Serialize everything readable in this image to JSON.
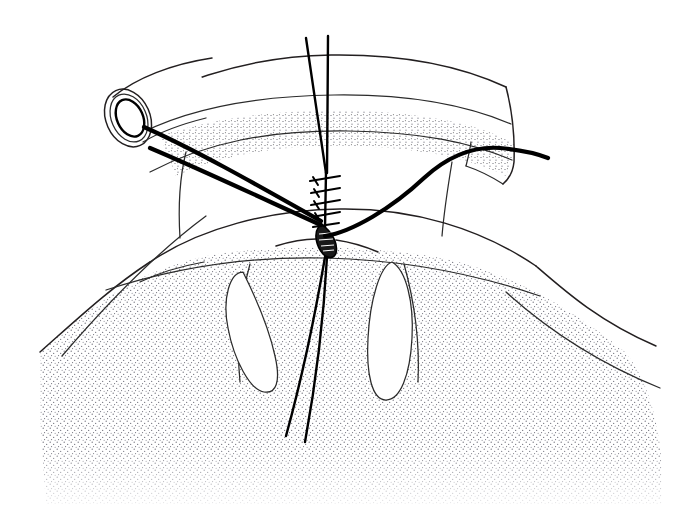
{
  "figure": {
    "kind": "line-art-illustration",
    "width": 699,
    "height": 516,
    "background_color": "#ffffff",
    "ink_color": "#000000",
    "hairline_color": "#2b2b2b",
    "stipple_color": "#5a5a66",
    "has_text_labels": false,
    "label_text": "",
    "caption_text": ""
  },
  "elements": {
    "tube": {
      "name": "tubular-graft-conduit",
      "end_ring_outer": "ellipse",
      "end_ring_inner": "ellipse",
      "lumen": "ellipse"
    },
    "band": {
      "name": "arched-band-upper",
      "fill": "#ffffff",
      "stipple_fill": "#ffffff"
    },
    "stippled_band": {
      "name": "stippled-arch-strip",
      "texture": "fine-dot-stipple"
    },
    "body": {
      "name": "stippled-organ-body",
      "texture": "fine-dot-stipple"
    },
    "suture_line": {
      "name": "running-suture-line",
      "stitch_count": 5
    },
    "incision": {
      "name": "almond-incision-aperture",
      "hatch_count": 4
    },
    "threads": {
      "upper_strands": 2,
      "lower_strands": 2,
      "instrument_strands": 2,
      "arc_thread": 1
    },
    "leaflets": {
      "name": "paired-leaflet-outlines",
      "count": 2
    }
  }
}
